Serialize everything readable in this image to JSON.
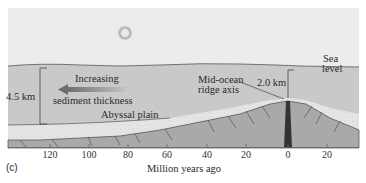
{
  "figure": {
    "panel_label": "(c)",
    "x_axis_title": "Million years ago",
    "x_ticks": [
      {
        "label": "120",
        "x": 50
      },
      {
        "label": "100",
        "x": 89
      },
      {
        "label": "80",
        "x": 128
      },
      {
        "label": "60",
        "x": 167
      },
      {
        "label": "40",
        "x": 207
      },
      {
        "label": "20",
        "x": 246
      },
      {
        "label": "0",
        "x": 288
      },
      {
        "label": "20",
        "x": 327
      }
    ],
    "labels": {
      "depth_abyssal": "4.5 km",
      "arrow_line1": "Increasing",
      "arrow_line2": "sediment thickness",
      "abyssal_plain": "Abyssal plain",
      "ridge_line1": "Mid-ocean",
      "ridge_line2": "ridge axis",
      "depth_ridge": "2.0 km",
      "sea_line1": "Sea",
      "sea_line2": "level"
    },
    "colors": {
      "sky": "#ececec",
      "ocean": "#c9c9c9",
      "sediment": "#e4e4e4",
      "crust": "#a9a9a9",
      "arrow": "#8a8a8a",
      "line": "#3a3a3a"
    }
  }
}
